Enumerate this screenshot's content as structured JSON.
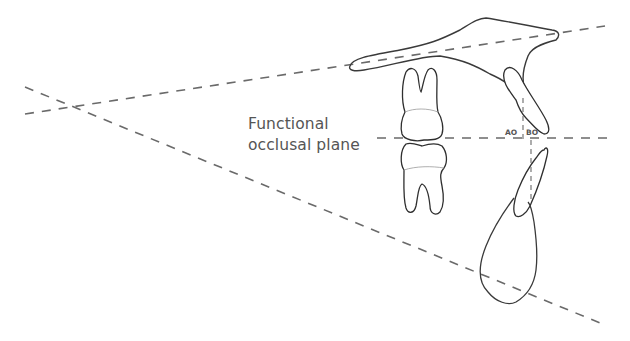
{
  "diagram": {
    "labels": {
      "functional_occlusal_plane_line1": "Functional",
      "functional_occlusal_plane_line2": "occlusal plane",
      "ao": "AO",
      "bo": "BO"
    },
    "colors": {
      "dashed_line": "#6a6a6a",
      "outline": "#3a3a3a",
      "text": "#555555",
      "background": "#ffffff"
    },
    "elements": [
      "upper-plane-line",
      "lower-plane-line",
      "functional-occlusal-plane-line",
      "maxilla-outline",
      "upper-molar",
      "lower-molar",
      "upper-incisor",
      "lower-incisor",
      "mandible-symphysis-outline",
      "ao-bo-vertical-lines"
    ]
  }
}
